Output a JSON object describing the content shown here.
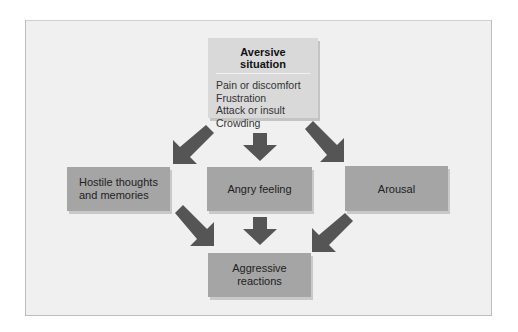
{
  "diagram": {
    "title": "Aversive situation",
    "sources": [
      "Pain or discomfort",
      "Frustration",
      "Attack or insult",
      "Crowding"
    ],
    "middle": {
      "left": "Hostile thoughts and memories",
      "left_lines": [
        "Hostile thoughts",
        "and memories"
      ],
      "center": "Angry feeling",
      "right": "Arousal"
    },
    "outcome": "Aggressive reactions",
    "outcome_lines": [
      "Aggressive",
      "reactions"
    ],
    "colors": {
      "background": "#f0f0f0",
      "top_box": "#d9d9d9",
      "node_box": "#a5a5a5",
      "arrow": "#555555"
    }
  }
}
